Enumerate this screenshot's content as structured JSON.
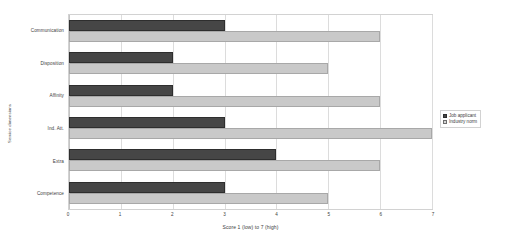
{
  "chart_data": {
    "type": "bar",
    "orientation": "horizontal",
    "title": "",
    "xlabel": "Score 1 (low) to 7 (high)",
    "ylabel": "Service dimensions",
    "xlim": [
      0,
      7
    ],
    "xticks": [
      0,
      1,
      2,
      3,
      4,
      5,
      6,
      7
    ],
    "xtick_labels": [
      "0",
      "1",
      "2",
      "3",
      "4",
      "5",
      "6",
      "7"
    ],
    "grid": true,
    "grid_axis": "x",
    "legend_position": "right",
    "categories": [
      "Communication",
      "Disposition",
      "Affinity",
      "Ind. Att.",
      "Extra",
      "Competence"
    ],
    "series": [
      {
        "name": "Job applicant",
        "color": "#464646",
        "values": [
          3,
          2,
          2,
          3,
          4,
          3
        ]
      },
      {
        "name": "Industry norm",
        "color": "#c9c9c9",
        "values": [
          6,
          5,
          6,
          7,
          6,
          5
        ]
      }
    ]
  },
  "legend": {
    "entries": [
      {
        "label": "Job applicant"
      },
      {
        "label": "Industry norm"
      }
    ]
  },
  "colors": {
    "series_applicant": "#464646",
    "series_norm": "#c9c9c9",
    "plot_border": "#d2d2d2",
    "gridline": "#dcdcdc",
    "text": "#3d3d3d",
    "background": "#ffffff"
  }
}
